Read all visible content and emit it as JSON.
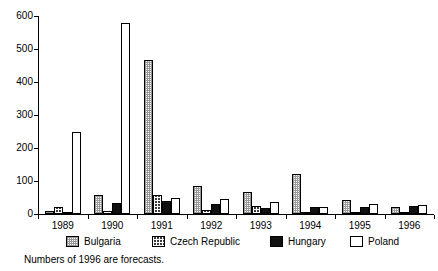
{
  "chart_data": {
    "type": "bar",
    "title": "",
    "subtitle": "",
    "xlabel": "",
    "ylabel": "",
    "ylim": [
      0,
      600
    ],
    "yticks": [
      0,
      100,
      200,
      300,
      400,
      500,
      600
    ],
    "grid": false,
    "legend_position": "bottom",
    "categories": [
      "1989",
      "1990",
      "1991",
      "1992",
      "1993",
      "1994",
      "1995",
      "1996"
    ],
    "series": [
      {
        "name": "Bulgaria",
        "fill": "light-dotted",
        "values": [
          8,
          57,
          468,
          85,
          68,
          122,
          42,
          20
        ]
      },
      {
        "name": "Czech Republic",
        "fill": "dark-dotted",
        "values": [
          22,
          10,
          57,
          12,
          25,
          5,
          7,
          6
        ]
      },
      {
        "name": "Hungary",
        "fill": "solid-black",
        "values": [
          6,
          32,
          38,
          30,
          17,
          20,
          22,
          24
        ]
      },
      {
        "name": "Poland",
        "fill": "white",
        "values": [
          250,
          580,
          48,
          44,
          36,
          22,
          30,
          28
        ]
      }
    ],
    "annotations": [
      "Numbers of 1996 are forecasts."
    ]
  },
  "axes": {
    "y_tick_labels": [
      "600",
      "500",
      "400",
      "300",
      "200",
      "100",
      "0"
    ],
    "x_tick_labels": [
      "1989",
      "1990",
      "1991",
      "1992",
      "1993",
      "1994",
      "1995",
      "1996"
    ]
  },
  "legend": {
    "items": [
      {
        "label": "Bulgaria"
      },
      {
        "label": "Czech Republic"
      },
      {
        "label": "Hungary"
      },
      {
        "label": "Poland"
      }
    ]
  },
  "footnote": {
    "text": "Numbers of 1996 are forecasts."
  },
  "colors": {
    "axis": "#000000",
    "bar_outline": "#000000",
    "bulgaria": "#c8c8c8",
    "czech": "#3a3a3a",
    "hungary": "#111111",
    "poland": "#ffffff"
  }
}
